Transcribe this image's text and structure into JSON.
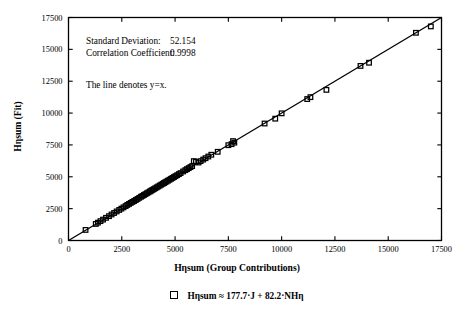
{
  "chart_data": {
    "type": "scatter",
    "title": "",
    "xlabel": "Hηsum (Group Contributions)",
    "ylabel": "Hηsum (Fit)",
    "xlim": [
      0,
      17500
    ],
    "ylim": [
      0,
      17500
    ],
    "xticks": [
      0,
      2500,
      5000,
      7500,
      10000,
      12500,
      15000,
      17500
    ],
    "yticks": [
      0,
      2500,
      5000,
      7500,
      10000,
      12500,
      15000,
      17500
    ],
    "xtick_labels": [
      "0",
      "2500",
      "5000",
      "7500",
      "10000",
      "12500",
      "15000",
      "17500"
    ],
    "ytick_labels": [
      "0",
      "2500",
      "5000",
      "7500",
      "10000",
      "12500",
      "15000",
      "17500"
    ],
    "grid": false,
    "legend_position": "below",
    "legend": [
      {
        "marker": "open-square",
        "label": "Hηsum ≈ 177.7·J + 82.2·NHη"
      }
    ],
    "reference_line": {
      "label": "y=x",
      "from": [
        0,
        0
      ],
      "to": [
        17500,
        17500
      ]
    },
    "annotations": [
      {
        "label": "Standard Deviation:",
        "value": "52.154"
      },
      {
        "label": "Correlation Coefficient:",
        "value": "0.9998"
      },
      {
        "text": "The line denotes y=x."
      }
    ],
    "statistics": {
      "standard_deviation": 52.154,
      "correlation_coefficient": 0.9998
    },
    "series": [
      {
        "name": "Hηsum ≈ 177.7·J + 82.2·NHη",
        "marker": "open-square",
        "points": [
          [
            800,
            830
          ],
          [
            1280,
            1300
          ],
          [
            1380,
            1400
          ],
          [
            1500,
            1520
          ],
          [
            1620,
            1640
          ],
          [
            1760,
            1780
          ],
          [
            1900,
            1910
          ],
          [
            2020,
            2040
          ],
          [
            2140,
            2160
          ],
          [
            2260,
            2280
          ],
          [
            2380,
            2400
          ],
          [
            2480,
            2500
          ],
          [
            2580,
            2600
          ],
          [
            2680,
            2700
          ],
          [
            2760,
            2790
          ],
          [
            2840,
            2870
          ],
          [
            2920,
            2950
          ],
          [
            3000,
            3030
          ],
          [
            3080,
            3100
          ],
          [
            3160,
            3180
          ],
          [
            3240,
            3260
          ],
          [
            3320,
            3350
          ],
          [
            3400,
            3430
          ],
          [
            3470,
            3500
          ],
          [
            3540,
            3570
          ],
          [
            3610,
            3640
          ],
          [
            3680,
            3710
          ],
          [
            3750,
            3780
          ],
          [
            3820,
            3850
          ],
          [
            3880,
            3910
          ],
          [
            3940,
            3970
          ],
          [
            4000,
            4030
          ],
          [
            4070,
            4100
          ],
          [
            4140,
            4170
          ],
          [
            4210,
            4240
          ],
          [
            4280,
            4310
          ],
          [
            4350,
            4380
          ],
          [
            4420,
            4450
          ],
          [
            4480,
            4510
          ],
          [
            4540,
            4570
          ],
          [
            4600,
            4630
          ],
          [
            4670,
            4700
          ],
          [
            4740,
            4770
          ],
          [
            4810,
            4840
          ],
          [
            4880,
            4910
          ],
          [
            4950,
            4980
          ],
          [
            5020,
            5050
          ],
          [
            5100,
            5130
          ],
          [
            5180,
            5210
          ],
          [
            5260,
            5290
          ],
          [
            5380,
            5420
          ],
          [
            5480,
            5520
          ],
          [
            5560,
            5600
          ],
          [
            5640,
            5680
          ],
          [
            5720,
            5760
          ],
          [
            5800,
            5840
          ],
          [
            5880,
            6230
          ],
          [
            5980,
            6180
          ],
          [
            6100,
            6120
          ],
          [
            6200,
            6230
          ],
          [
            6320,
            6350
          ],
          [
            6430,
            6460
          ],
          [
            6560,
            6590
          ],
          [
            6700,
            6730
          ],
          [
            7000,
            6960
          ],
          [
            7500,
            7480
          ],
          [
            7650,
            7560
          ],
          [
            7720,
            7800
          ],
          [
            7780,
            7680
          ],
          [
            9200,
            9180
          ],
          [
            9700,
            9560
          ],
          [
            10000,
            9980
          ],
          [
            11200,
            11100
          ],
          [
            11350,
            11250
          ],
          [
            12100,
            11820
          ],
          [
            13700,
            13700
          ],
          [
            14100,
            13950
          ],
          [
            16300,
            16300
          ],
          [
            17000,
            16800
          ]
        ]
      }
    ]
  }
}
